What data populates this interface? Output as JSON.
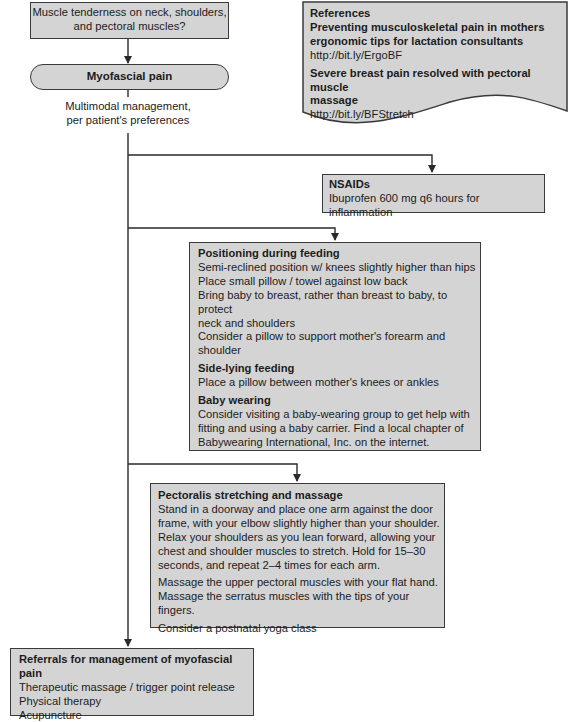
{
  "question": {
    "lines": [
      "Muscle tenderness on neck, shoulders,",
      "and pectoral muscles?"
    ]
  },
  "diagnosis": {
    "label": "Myofascial pain"
  },
  "management_note": {
    "lines": [
      "Multimodal management,",
      "per patient's preferences"
    ]
  },
  "references": {
    "title": "References",
    "items": [
      {
        "title_lines": [
          "Preventing musculoskeletal pain in mothers",
          "ergonomic tips for lactation consultants"
        ],
        "link": "http://bit.ly/ErgoBF"
      },
      {
        "title_lines": [
          "Severe breast pain resolved with pectoral muscle",
          "massage"
        ],
        "link": "http://bit.ly/BFStretch"
      }
    ]
  },
  "nsaids": {
    "title": "NSAIDs",
    "lines": [
      "Ibuprofen 600 mg q6 hours for inflammation"
    ]
  },
  "positioning": {
    "sections": [
      {
        "title": "Positioning during feeding",
        "lines": [
          "Semi-reclined position w/ knees slightly higher than hips",
          "Place small pillow / towel against low back",
          "Bring baby to breast, rather than breast to baby, to protect",
          "neck and shoulders",
          "Consider a pillow to support mother's forearm and",
          "shoulder"
        ]
      },
      {
        "title": "Side-lying feeding",
        "lines": [
          "Place a pillow between mother's knees or ankles"
        ]
      },
      {
        "title": "Baby wearing",
        "lines": [
          "Consider visiting a baby-wearing group to get help with",
          "fitting and using a baby carrier. Find a local chapter of",
          "Babywearing International, Inc. on the internet."
        ]
      }
    ]
  },
  "pectoralis": {
    "title": "Pectoralis stretching and massage",
    "paragraphs": [
      [
        "Stand in a doorway and place one arm against the door",
        "frame, with your elbow slightly higher than your shoulder.",
        "Relax your shoulders as you lean forward, allowing your",
        "chest and shoulder muscles to stretch. Hold for 15–30",
        "seconds, and repeat 2–4 times for each arm."
      ],
      [
        "Massage the upper pectoral muscles with your flat hand.",
        "Massage the serratus muscles with the tips of your fingers."
      ],
      [
        "Consider a postnatal yoga class"
      ]
    ]
  },
  "referrals": {
    "title": "Referrals for management of myofascial pain",
    "lines": [
      "Therapeutic massage / trigger point release",
      "Physical therapy",
      "Acupuncture"
    ]
  },
  "colors": {
    "box_fill": "#d4d4d4",
    "border": "#3a3a3a",
    "text": "#1c1c1c",
    "background": "#ffffff"
  }
}
